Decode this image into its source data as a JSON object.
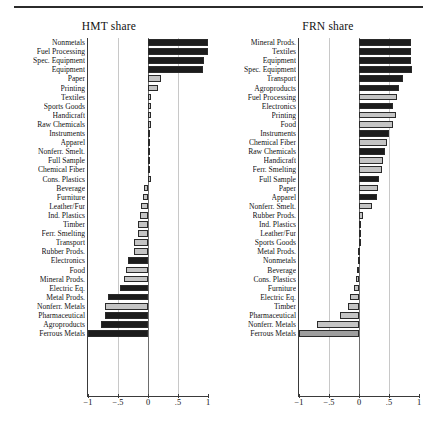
{
  "figure": {
    "top_rule": true,
    "panels": [
      {
        "id": "hmt",
        "title": "HMT share"
      },
      {
        "id": "frn",
        "title": "FRN share"
      }
    ]
  },
  "chart_data": [
    {
      "type": "bar",
      "orientation": "horizontal",
      "title": "HMT share",
      "xlabel": "",
      "ylabel": "",
      "xlim": [
        -1,
        1
      ],
      "xticks": [
        -1,
        -0.5,
        0,
        0.5,
        1
      ],
      "xticklabels": [
        "−1",
        "−.5",
        "0",
        ".5",
        "1"
      ],
      "grid": true,
      "gridlines_at": [
        -0.5,
        0.5
      ],
      "zero_reference_line": 0,
      "legend": "none",
      "shading_note": "bars rendered in two fill tones (dark = solid black, light = grey)",
      "categories": [
        "Nonmetals",
        "Fuel Processing",
        "Spec. Equipment",
        "Equipment",
        "Paper",
        "Printing",
        "Textiles",
        "Sports Goods",
        "Handicraft",
        "Raw Chemicals",
        "Instruments",
        "Apparel",
        "Nonferr. Smelt.",
        "Full Sample",
        "Chemical Fiber",
        "Cons. Plastics",
        "Beverage",
        "Furniture",
        "Leather/Fur",
        "Ind. Plastics",
        "Timber",
        "Ferr. Smelting",
        "Transport",
        "Rubber Prods.",
        "Electronics",
        "Food",
        "Mineral Prods.",
        "Electric Eq.",
        "Metal Prods.",
        "Nonferr. Metals",
        "Pharmaceutical",
        "Agroproducts",
        "Ferrous Metals"
      ],
      "values": [
        1.0,
        1.0,
        0.94,
        0.92,
        0.22,
        0.16,
        0.05,
        0.05,
        0.05,
        0.05,
        0.03,
        0.02,
        0.02,
        0.02,
        0.01,
        0.05,
        -0.06,
        -0.08,
        -0.11,
        -0.13,
        -0.16,
        -0.17,
        -0.24,
        -0.24,
        -0.34,
        -0.37,
        -0.4,
        -0.47,
        -0.66,
        -0.71,
        -0.72,
        -0.78,
        -1.0
      ],
      "fills": [
        "dark",
        "dark",
        "dark",
        "dark",
        "light",
        "light",
        "light",
        "light",
        "light",
        "light",
        "light",
        "light",
        "light",
        "light",
        "light",
        "light",
        "light",
        "light",
        "light",
        "light",
        "light",
        "light",
        "light",
        "light",
        "dark",
        "light",
        "light",
        "dark",
        "dark",
        "light",
        "dark",
        "dark",
        "dark"
      ]
    },
    {
      "type": "bar",
      "orientation": "horizontal",
      "title": "FRN share",
      "xlabel": "",
      "ylabel": "",
      "xlim": [
        -1,
        1
      ],
      "xticks": [
        -1,
        -0.5,
        0,
        0.5,
        1
      ],
      "xticklabels": [
        "−1",
        "−.5",
        "0",
        ".5",
        "1"
      ],
      "grid": true,
      "gridlines_at": [
        -0.5,
        0.5
      ],
      "zero_reference_line": 0,
      "legend": "none",
      "shading_note": "bars rendered in two fill tones (dark = solid black, light = grey)",
      "categories": [
        "Mineral Prods.",
        "Textiles",
        "Equipment",
        "Spec. Equipment",
        "Transport",
        "Agroproducts",
        "Fuel Processing",
        "Electronics",
        "Printing",
        "Food",
        "Instruments",
        "Chemical Fiber",
        "Raw Chemicals",
        "Handicraft",
        "Ferr. Smelting",
        "Full Sample",
        "Paper",
        "Apparel",
        "Nonferr. Smelt.",
        "Rubber Prods.",
        "Ind. Plastics",
        "Leather/Fur",
        "Sports Goods",
        "Metal Prods.",
        "Nonmetals",
        "Beverage",
        "Cons. Plastics",
        "Furniture",
        "Electric Eq.",
        "Timber",
        "Pharmaceutical",
        "Nonferr. Metals",
        "Ferrous Metals"
      ],
      "values": [
        0.86,
        0.87,
        0.86,
        0.88,
        0.74,
        0.67,
        0.64,
        0.56,
        0.62,
        0.57,
        0.5,
        0.46,
        0.43,
        0.4,
        0.39,
        0.33,
        0.32,
        0.3,
        0.22,
        0.07,
        0.04,
        0.01,
        0.01,
        -0.02,
        -0.02,
        -0.03,
        -0.05,
        -0.09,
        -0.15,
        -0.18,
        -0.31,
        -0.7,
        -1.0
      ],
      "fills": [
        "dark",
        "dark",
        "dark",
        "dark",
        "dark",
        "dark",
        "light",
        "dark",
        "light",
        "light",
        "dark",
        "light",
        "dark",
        "light",
        "light",
        "dark",
        "light",
        "dark",
        "light",
        "light",
        "light",
        "light",
        "light",
        "light",
        "light",
        "light",
        "light",
        "light",
        "light",
        "light",
        "light",
        "light",
        "mid"
      ]
    }
  ]
}
